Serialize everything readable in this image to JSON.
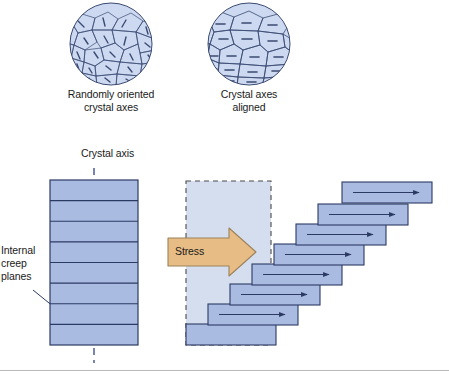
{
  "figure": {
    "background_color": "#ffffff",
    "slab_fill": "#aabbe2",
    "slab_fill_light": "#ccd7ef",
    "slab_stroke": "#2b3a63",
    "grain_fill": "#ccd9f0",
    "grain_stroke": "#3b4a72",
    "arrow_fill": "#e8bd85",
    "arrow_stroke": "#9c8259",
    "axis_dash_color": "#55679c",
    "text_color": "#1a1a1a",
    "rule_color": "#b9b9b9"
  },
  "micrographs": [
    {
      "id": "randomly-oriented",
      "caption": "Randomly oriented\ncrystal axes",
      "center_x": 111,
      "center_y": 44,
      "radius": 41,
      "orientation": "random"
    },
    {
      "id": "aligned",
      "caption": "Crystal axes\naligned",
      "center_x": 249,
      "center_y": 44,
      "radius": 41,
      "orientation": "aligned"
    }
  ],
  "diagram": {
    "crystal_axis_label": "Crystal axis",
    "creep_planes_label": "Internal\ncreep\nplanes",
    "stress_label": "Stress",
    "undeformed_stack": {
      "x": 50,
      "y": 180,
      "width": 88,
      "height": 165,
      "plane_count": 8
    },
    "ghost_outline": {
      "x": 186,
      "y": 181,
      "width": 85,
      "height": 164,
      "style": "dashed"
    },
    "sheared_stack": {
      "slab_width": 90,
      "slab_height": 21,
      "step_x": 22,
      "step_y": 20,
      "bottom_x": 186,
      "bottom_y": 324,
      "slab_count": 8,
      "arrow_direction": "right"
    }
  },
  "footer_rule": {
    "y": 370,
    "visible": true
  }
}
